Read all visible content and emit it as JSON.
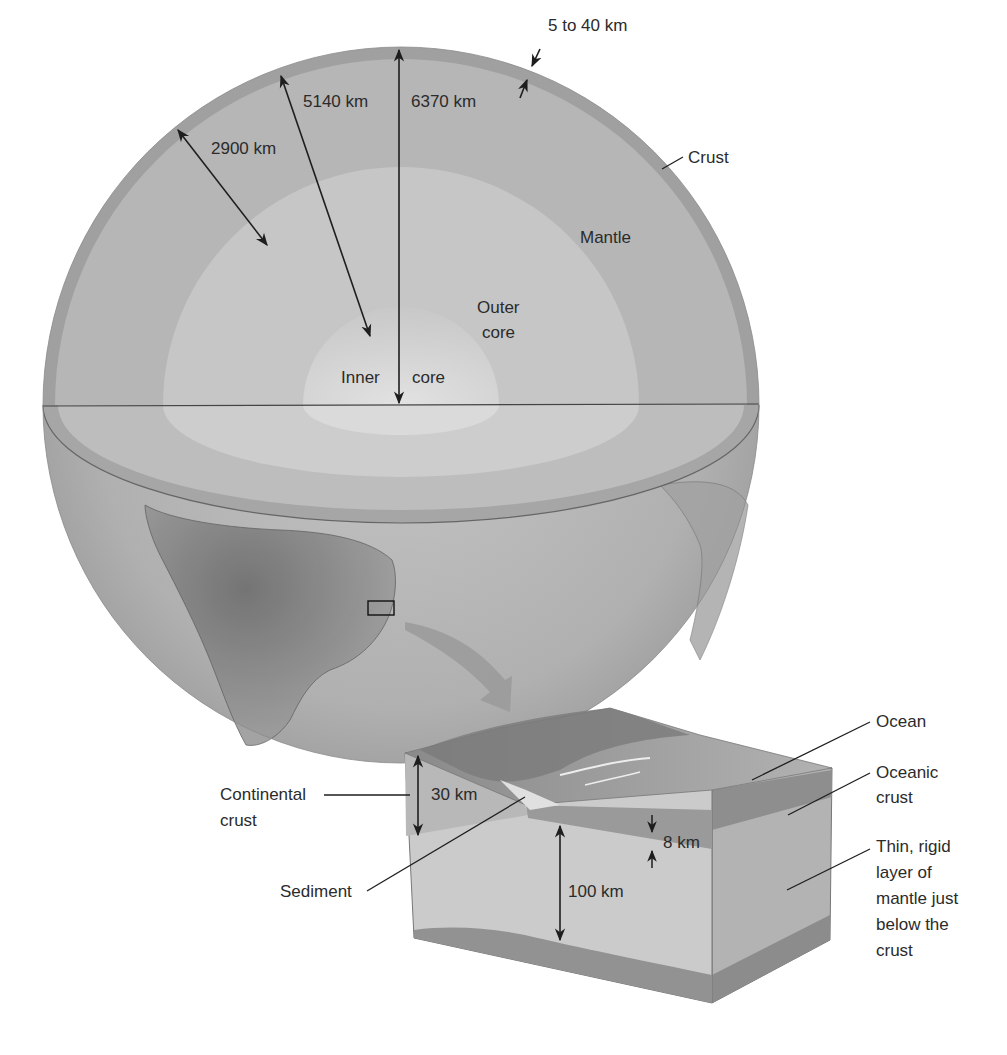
{
  "figure": {
    "globe": {
      "layers": [
        {
          "name": "Crust",
          "label": "Crust"
        },
        {
          "name": "Mantle",
          "label": "Mantle"
        },
        {
          "name": "Outer core",
          "label_line1": "Outer",
          "label_line2": "core"
        },
        {
          "name": "Inner core",
          "label_left": "Inner",
          "label_right": "core"
        }
      ],
      "dimensions": {
        "crust_thickness": "5 to 40 km",
        "mantle_depth": "2900 km",
        "inner_core_depth": "5140 km",
        "earth_radius": "6370 km"
      }
    },
    "block": {
      "labels": {
        "ocean": "Ocean",
        "oceanic_crust_line1": "Oceanic",
        "oceanic_crust_line2": "crust",
        "continental_crust_line1": "Continental",
        "continental_crust_line2": "crust",
        "sediment": "Sediment",
        "lithosphere_line1": "Thin, rigid",
        "lithosphere_line2": "layer of",
        "lithosphere_line3": "mantle just",
        "lithosphere_line4": "below the",
        "lithosphere_line5": "crust"
      },
      "dimensions": {
        "continental_crust": "30 km",
        "oceanic_crust": "8 km",
        "lithosphere": "100 km"
      }
    },
    "colors": {
      "crust": "#9c9c9c",
      "mantle": "#b4b4b4",
      "outer_core": "#c8c8c8",
      "inner_core": "#d6d6d6",
      "continent": "#7e7e7e",
      "line": "#1e1e1e"
    }
  }
}
